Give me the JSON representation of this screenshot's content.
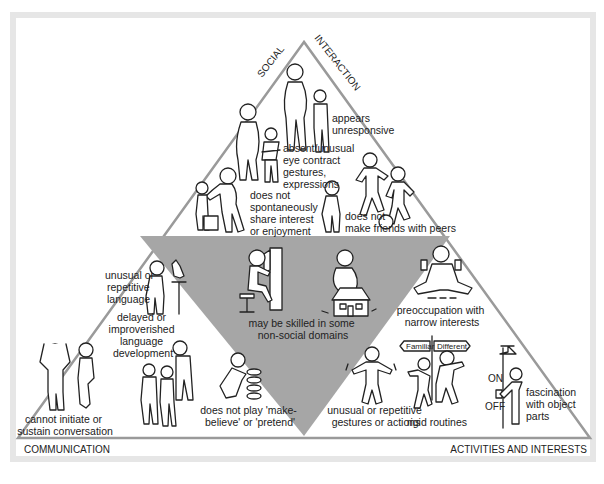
{
  "figure": {
    "axes": {
      "top_left": "SOCIAL",
      "top_right": "INTERACTION",
      "bottom_left": "COMMUNICATION",
      "bottom_right": "ACTIVITIES AND INTERESTS"
    },
    "social_interaction": [
      {
        "id": "unresponsive",
        "lines": [
          "appears",
          "unresponsive"
        ]
      },
      {
        "id": "eye-contact",
        "lines": [
          "absent/unusual",
          "eye contract",
          "gestures,",
          "expressions"
        ]
      },
      {
        "id": "share-interest",
        "lines": [
          "does not",
          "spontaneously",
          "share interest",
          "or enjoyment"
        ]
      },
      {
        "id": "friends",
        "lines": [
          "does not",
          "make friends with peers"
        ]
      }
    ],
    "center": {
      "lines": [
        "may be skilled in some",
        "non-social domains"
      ]
    },
    "communication": [
      {
        "id": "unusual-language",
        "lines": [
          "unusual or",
          "repetitive",
          "language"
        ]
      },
      {
        "id": "delayed-language",
        "lines": [
          "delayed or",
          "improverished",
          "language",
          "development"
        ]
      },
      {
        "id": "conversation",
        "lines": [
          "cannot initiate or",
          "sustain conversation"
        ]
      },
      {
        "id": "pretend-play",
        "lines": [
          "does not play 'make-",
          "believe' or 'pretend'"
        ]
      }
    ],
    "activities_interests": [
      {
        "id": "preoccupation",
        "lines": [
          "preoccupation with",
          "narrow interests"
        ]
      },
      {
        "id": "gestures",
        "lines": [
          "unusual or repetitive",
          "gestures or actions"
        ]
      },
      {
        "id": "routines",
        "lines": [
          "rigid routines"
        ]
      },
      {
        "id": "object-parts",
        "lines": [
          "fascination",
          "with object",
          "parts"
        ]
      }
    ],
    "signs": {
      "left": "Familiar",
      "right": "Different"
    },
    "switch": {
      "on": "ON",
      "off": "OFF"
    },
    "colors": {
      "frame": "#e6e6e6",
      "triangle_edge": "#999999",
      "center_fill": "#a6a6a6",
      "ink": "#222222"
    }
  }
}
